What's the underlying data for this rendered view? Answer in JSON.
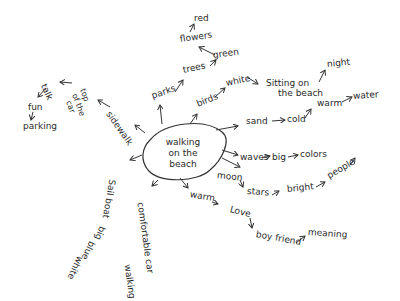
{
  "center": {
    "line1": "walking",
    "line2": "on the",
    "line3": "beach"
  },
  "nodes": {
    "parks": "parks",
    "trees": "trees",
    "flowers": "flowers",
    "red": "red",
    "green": "green",
    "birds": "birds",
    "white_birds": "white",
    "sitting_on": "Sitting on",
    "the_beach": "the beach",
    "night": "night",
    "sand": "sand",
    "cold": "cold",
    "warm_sand": "warm",
    "water": "water",
    "waves": "waves",
    "big_waves": "big",
    "colors": "colors",
    "moon": "moon",
    "stars": "stars",
    "bright": "bright",
    "people": "people",
    "warm": "warm",
    "love": "Love",
    "boyfriend": "boy friend",
    "meaning": "meaning",
    "comfortable_car": "comfortable car",
    "walking": "walking",
    "sail_boat": "Sail boat",
    "big_boat": "big",
    "blue": "blue",
    "white_boat": "white",
    "sidewalk": "sidewalk",
    "top_of_car_1": "top",
    "top_of_car_2": "of the",
    "top_of_car_3": "car",
    "talk": "talk",
    "fun": "fun",
    "parking": "parking"
  }
}
